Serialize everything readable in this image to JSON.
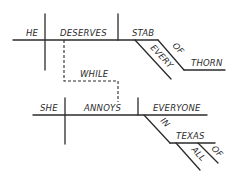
{
  "diagram": {
    "type": "sentence-diagram",
    "clause1": {
      "subject": "HE",
      "verb": "DESERVES",
      "object": "STAB",
      "object_modifiers": [
        "EVERY"
      ],
      "prepositional_phrase": {
        "preposition": "OF",
        "object": "THORN"
      }
    },
    "connector": "WHILE",
    "clause2": {
      "subject": "SHE",
      "verb": "ANNOYS",
      "object": "EVERYONE",
      "prepositional_phrase": {
        "preposition": "IN",
        "object": "TEXAS",
        "modifiers": [
          "ALL",
          "OF"
        ]
      }
    }
  }
}
